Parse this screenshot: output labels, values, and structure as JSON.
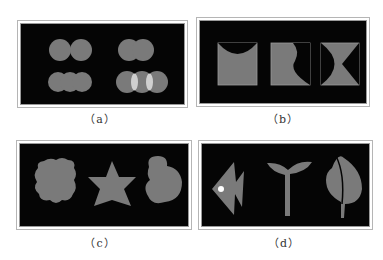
{
  "figure": {
    "panels": [
      {
        "id": "a",
        "caption": "（a）",
        "description": "pairs and triples of overlapping circles; last group shows light lens-shaped overlap regions"
      },
      {
        "id": "b",
        "caption": "（b）",
        "description": "three squares with curved/triangular black cutouts"
      },
      {
        "id": "c",
        "caption": "（c）",
        "description": "scalloped blob, six-pointed star, irregular rounded blob"
      },
      {
        "id": "d",
        "caption": "（d）",
        "description": "fish with white eye, seedling sprout, leaf"
      }
    ],
    "colors": {
      "background": "#050505",
      "shape": "#7a7a7a",
      "highlight": "#cfcfcf",
      "eye": "#ffffff"
    }
  }
}
